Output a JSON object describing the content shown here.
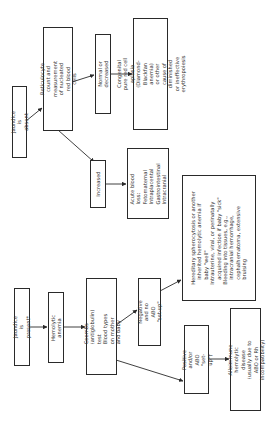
{
  "flowchart": {
    "jaundice_absent": "Jaundice is absent",
    "reticulocyte": "Reticulocyte count and\nmeasurement of nucleated\nred blood cells",
    "normal_decreased": "Normal or decreased",
    "congenital": "Congenital pure red cell aplasia\n(Diamond-Blackfan anemia)\nor other cause of diminished\nor ineffective erythropoiesis",
    "increased": "Increased",
    "acute_blood_loss": "Acute blood loss:\nFetomaternal\nIntraplacental\nGastrointestinal\nIntracranial",
    "hereditary": "Hereditary spherocytosis or another\n   inherited hemolytic anemia if\n   baby \"well\"\nIntrauterine, viral, or perinatally\n   acquired infection if baby \"sick\"\nBleeding into tissues, e.g.,\n   intracranial hemorrhage,\n   cephalhematoma, extensive\n   bruising",
    "jaundice_present": "Jaundice is present*",
    "hemolytic_anemia": "Hemolytic anemia",
    "coombs": "Coombs (antiglobulin) test\nBlood types on mother\nand baby",
    "negative": "Negative and no\nABO \"set-up\"",
    "positive": "Positive and/or\nABO \"set-up\"†",
    "alloimmune": "Alloimmune hemolytic\ndisease (usually due to\nABO or Rh incompatibility)"
  },
  "colors": {
    "line": "#2a2a2a",
    "text": "#333333",
    "background": "#ffffff"
  }
}
